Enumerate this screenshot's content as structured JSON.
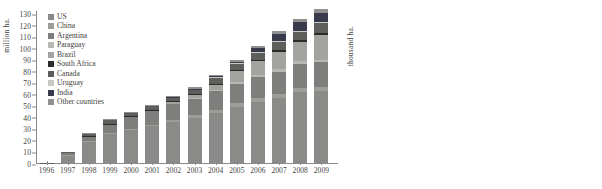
{
  "figure": {
    "panels": [
      "global-gm-area-by-country",
      "europe-gm-area-by-country"
    ]
  },
  "chart_data": [
    {
      "id": "left",
      "type": "bar",
      "subtype": "stacked-vertical",
      "title": "",
      "xlabel": "",
      "ylabel": "million ha.",
      "ylim": [
        0,
        130
      ],
      "yticks": [
        0,
        10,
        20,
        30,
        40,
        50,
        60,
        70,
        80,
        90,
        100,
        110,
        120,
        130
      ],
      "ytick_labels": [
        "0",
        "10",
        "20",
        "30",
        "40",
        "50",
        "60",
        "70",
        "80",
        "90",
        "100",
        "110",
        "120",
        "130"
      ],
      "grid": false,
      "legend_position": "upper-left",
      "categories": [
        "1996",
        "1997",
        "1998",
        "1999",
        "2000",
        "2001",
        "2002",
        "2003",
        "2004",
        "2005",
        "2006",
        "2007",
        "2008",
        "2009"
      ],
      "series": [
        {
          "name": "US",
          "color": "#8a8a88",
          "values": [
            1.0,
            7.6,
            19.2,
            26.0,
            29.5,
            32.8,
            36.7,
            40.2,
            43.8,
            49.2,
            53.9,
            56.8,
            62.2,
            63.0
          ]
        },
        {
          "name": "China",
          "color": "#9d9d9a",
          "values": [
            0.0,
            0.4,
            0.6,
            0.8,
            0.9,
            1.1,
            1.8,
            2.1,
            3.1,
            3.3,
            3.5,
            3.8,
            3.8,
            3.7
          ]
        },
        {
          "name": "Argentina",
          "color": "#7e7e7c",
          "values": [
            0.1,
            1.4,
            4.3,
            6.7,
            10.0,
            11.8,
            13.5,
            13.9,
            16.2,
            17.1,
            18.0,
            19.1,
            21.0,
            21.3
          ]
        },
        {
          "name": "Paraguay",
          "color": "#b7b7b3",
          "values": [
            0.0,
            0.0,
            0.0,
            0.0,
            0.0,
            0.0,
            0.0,
            1.2,
            1.2,
            1.8,
            2.0,
            2.6,
            2.7,
            2.2
          ]
        },
        {
          "name": "Brazil",
          "color": "#a3a39f",
          "values": [
            0.0,
            0.0,
            0.0,
            1.2,
            1.3,
            1.3,
            2.5,
            3.0,
            5.0,
            9.4,
            11.5,
            15.0,
            15.8,
            21.4
          ]
        },
        {
          "name": "South Africa",
          "color": "#2b2b29",
          "values": [
            0.0,
            0.0,
            0.1,
            0.1,
            0.2,
            0.2,
            0.3,
            0.4,
            0.5,
            0.5,
            1.4,
            1.8,
            1.8,
            2.1
          ]
        },
        {
          "name": "Canada",
          "color": "#5e5e5c",
          "values": [
            0.1,
            1.3,
            2.8,
            4.0,
            3.0,
            3.2,
            3.5,
            4.4,
            5.4,
            5.8,
            6.1,
            7.0,
            7.6,
            8.2
          ]
        },
        {
          "name": "Uruguay",
          "color": "#c8c8c4",
          "values": [
            0.0,
            0.0,
            0.0,
            0.0,
            0.0,
            0.0,
            0.0,
            0.1,
            0.3,
            0.3,
            0.4,
            0.5,
            0.7,
            0.8
          ]
        },
        {
          "name": "India",
          "color": "#3a3a4d",
          "values": [
            0.0,
            0.0,
            0.0,
            0.0,
            0.0,
            0.0,
            0.1,
            0.1,
            0.5,
            1.3,
            3.8,
            6.2,
            7.6,
            8.4
          ]
        },
        {
          "name": "Other countries",
          "color": "#909090",
          "values": [
            0.0,
            0.0,
            0.2,
            0.4,
            0.5,
            0.6,
            0.8,
            1.0,
            1.3,
            1.6,
            2.1,
            2.3,
            2.6,
            3.0
          ]
        }
      ]
    },
    {
      "id": "right",
      "type": "bar",
      "subtype": "stacked-vertical",
      "title": "",
      "xlabel": "",
      "ylabel": "thousand ha.",
      "ylim": [
        0,
        210
      ],
      "yticks": [
        0,
        30,
        60,
        90,
        120,
        150,
        180,
        210
      ],
      "ytick_labels": [
        "0",
        "30",
        "60",
        "90",
        "120",
        "150",
        "180",
        "210"
      ],
      "grid": false,
      "legend_position": "upper-right",
      "categories": [
        "2005",
        "2006",
        "2007",
        "2008",
        "2009"
      ],
      "series": [
        {
          "name": "Poland",
          "color": "#8e8e8a",
          "values": [
            null,
            null,
            null,
            null,
            null
          ]
        },
        {
          "name": "Portugal",
          "color": "#a8a8a4",
          "values": [
            null,
            null,
            null,
            null,
            null
          ]
        },
        {
          "name": "Romania",
          "color": "#74746f",
          "values": [
            null,
            null,
            null,
            null,
            null
          ]
        },
        {
          "name": "Czech Republic",
          "color": "#6a6a66",
          "values": [
            null,
            null,
            null,
            null,
            null
          ]
        },
        {
          "name": "Slovakia",
          "color": "#bdbdb9",
          "values": [
            null,
            null,
            null,
            null,
            null
          ]
        },
        {
          "name": "France",
          "color": "#d2d2ce",
          "values": [
            null,
            null,
            null,
            null,
            null
          ]
        },
        {
          "name": "Germany",
          "color": "#23231f",
          "values": [
            null,
            null,
            null,
            null,
            null
          ]
        }
      ],
      "bars": [
        {
          "category": "2005",
          "total": 165.0,
          "top_label": "",
          "segments": [
            {
              "name": "Spain",
              "value": 51.225,
              "label": "51.225",
              "height": 53.0,
              "color": "#8e8e8a",
              "label_color": "light"
            },
            {
              "name": "France",
              "value": 0.498,
              "label": "498",
              "height": 1.5,
              "color": "#bdbdb9",
              "label_color": "light"
            },
            {
              "name": "other",
              "value": 110.0,
              "label": "110.000",
              "height": 110.5,
              "color": "#76766f",
              "label_color": "light"
            }
          ]
        },
        {
          "category": "2006",
          "total": 199.0,
          "top_label": "",
          "segments": [
            {
              "name": "Spain",
              "value": 51.667,
              "label": "51.667",
              "height": 54.0,
              "color": "#8e8e8a",
              "label_color": "light"
            },
            {
              "name": "France",
              "value": 5.0,
              "label": "5.000",
              "height": 7.0,
              "color": "#bdbdb9",
              "label_color": "light"
            },
            {
              "name": "other",
              "value": 137.0,
              "label": "137.000",
              "height": 138.0,
              "color": "#76766f",
              "label_color": "light"
            }
          ]
        },
        {
          "category": "2007",
          "total": 107.0,
          "top_label": "350",
          "segments": [
            {
              "name": "Spain",
              "value": 75.148,
              "label": "75.148",
              "height": 75.5,
              "color": "#8e8e8a",
              "label_color": "light"
            },
            {
              "name": "France",
              "value": 21.147,
              "label": "21.147",
              "height": 22.0,
              "color": "#bdbdb9",
              "label_color": "dark"
            },
            {
              "name": "Germany",
              "value": 0.35,
              "label": "",
              "height": 5.0,
              "color": "#23231f",
              "label_color": "light"
            },
            {
              "name": "other",
              "value": 4.0,
              "label": "",
              "height": 4.5,
              "color": "#76766f",
              "label_color": "light"
            }
          ]
        },
        {
          "category": "2008",
          "total": 108.0,
          "top_label": "7.146",
          "segments": [
            {
              "name": "Spain",
              "value": 79.269,
              "label": "79.269",
              "height": 80.0,
              "color": "#8e8e8a",
              "label_color": "light"
            },
            {
              "name": "other",
              "value": 14.0,
              "label": "",
              "height": 14.5,
              "color": "#7e7e79",
              "label_color": "light"
            },
            {
              "name": "Germany",
              "value": 7.146,
              "label": "",
              "height": 6.5,
              "color": "#23231f",
              "label_color": "light"
            },
            {
              "name": "top",
              "value": 7.0,
              "label": "",
              "height": 7.0,
              "color": "#8e8e8a",
              "label_color": "light"
            }
          ]
        },
        {
          "category": "2009",
          "total": 95.0,
          "top_label": "3.244",
          "segments": [
            {
              "name": "Spain",
              "value": 76.057,
              "label": "76.057",
              "height": 77.0,
              "color": "#8e8e8a",
              "label_color": "light"
            },
            {
              "name": "other",
              "value": 14.0,
              "label": "",
              "height": 14.0,
              "color": "#7e7e79",
              "label_color": "light"
            },
            {
              "name": "top",
              "value": 3.244,
              "label": "",
              "height": 4.0,
              "color": "#a8a8a4",
              "label_color": "light"
            }
          ]
        }
      ]
    }
  ]
}
